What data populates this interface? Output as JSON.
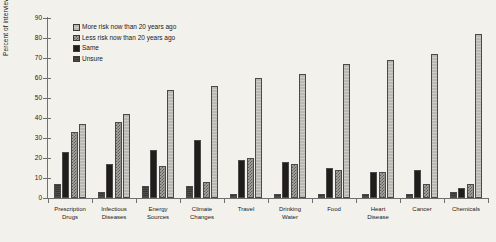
{
  "chart_data": {
    "type": "bar",
    "title": "",
    "xlabel": "",
    "ylabel": "Percent of interviewees",
    "ylim": [
      0,
      90
    ],
    "yticks": [
      0,
      10,
      20,
      30,
      40,
      50,
      60,
      70,
      80,
      90
    ],
    "grid": false,
    "legend_position": "top-left",
    "categories": [
      "Prescription\nDrugs",
      "Infectious\nDiseases",
      "Energy\nSources",
      "Climate\nChanges",
      "Travel",
      "Drinking\nWater",
      "Food",
      "Heart\nDisease",
      "Cancer",
      "Chemicals"
    ],
    "series": [
      {
        "name": "Unsure",
        "key": "s-unsure",
        "values": [
          7,
          3,
          6,
          6,
          2,
          2,
          2,
          2,
          2,
          3
        ]
      },
      {
        "name": "Same",
        "key": "s-same",
        "values": [
          23,
          17,
          24,
          29,
          19,
          18,
          15,
          13,
          14,
          5
        ]
      },
      {
        "name": "Less risk now than 20 years ago",
        "key": "s-less",
        "values": [
          33,
          38,
          16,
          8,
          20,
          17,
          14,
          13,
          7,
          7
        ]
      },
      {
        "name": "More risk now than 20 years ago",
        "key": "s-more",
        "values": [
          37,
          42,
          54,
          56,
          60,
          62,
          67,
          69,
          72,
          82
        ]
      }
    ],
    "bar_order": [
      "Unsure",
      "Same",
      "Less risk now than 20 years ago",
      "More risk now than 20 years ago"
    ]
  },
  "legend": {
    "items": [
      {
        "label": "More risk now than 20 years ago",
        "key": "s-more"
      },
      {
        "label": "Less risk now than 20 years ago",
        "key": "s-less"
      },
      {
        "label": "Same",
        "key": "s-same"
      },
      {
        "label": "Unsure",
        "key": "s-unsure"
      }
    ]
  },
  "colors": {
    "background": "#f2f1ec",
    "axis": "#6f6f6f",
    "text": "#1a1a1a",
    "more": "#b9b8b2",
    "less": "#a9a8a2",
    "same": "#211d1b",
    "unsure": "#3a3431"
  }
}
